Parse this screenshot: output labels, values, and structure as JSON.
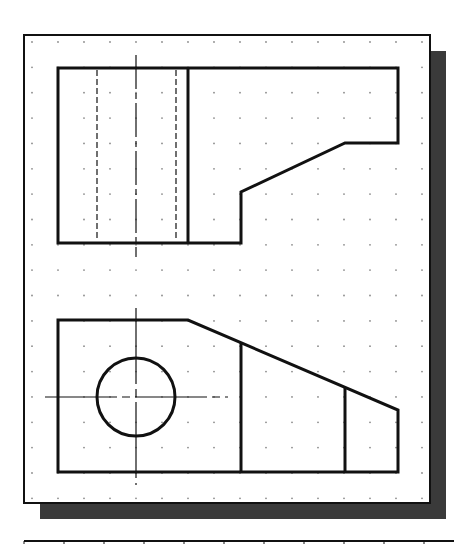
{
  "drawing": {
    "type": "orthographic-views",
    "colors": {
      "background": "#ffffff",
      "paper": "#ffffff",
      "frame": "#111111",
      "shadow": "#3a3a3a",
      "object_line": "#111111",
      "grid_dot": "#8a8a8a"
    },
    "frame": {
      "x": 24,
      "y": 35,
      "width": 406,
      "height": 468
    },
    "shadow": {
      "offset_x": 16,
      "offset_y": 16
    },
    "grid": {
      "x0": 32,
      "y0": 42,
      "dx": 26,
      "dy": 25.35,
      "cols": 16,
      "rows": 19
    },
    "top_view": {
      "outline": [
        [
          58,
          68
        ],
        [
          398,
          68
        ],
        [
          398,
          143
        ],
        [
          345,
          143
        ],
        [
          241,
          192
        ],
        [
          241,
          243
        ],
        [
          58,
          243
        ]
      ],
      "divider_x": 188,
      "hidden_lines_x": [
        97,
        176
      ],
      "centerline": {
        "x": 136,
        "y1": 55,
        "y2": 257
      }
    },
    "front_view": {
      "outline": [
        [
          58,
          320
        ],
        [
          188,
          320
        ],
        [
          398,
          410
        ],
        [
          398,
          472
        ],
        [
          58,
          472
        ]
      ],
      "vertical_edges": [
        {
          "x": 241,
          "y_top": 343
        },
        {
          "x": 345,
          "y_top": 387
        }
      ],
      "hole": {
        "cx": 136,
        "cy": 397,
        "r": 39
      },
      "centerline_v": {
        "x": 136,
        "y1": 308,
        "y2": 485
      },
      "centerline_h": {
        "y": 397,
        "x1": 45,
        "x2": 228
      }
    },
    "bottom_strip": {
      "x": 24,
      "y": 541,
      "width": 430,
      "tick_spacing": 40
    }
  }
}
